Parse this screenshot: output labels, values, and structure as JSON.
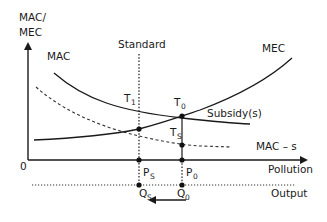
{
  "diagram": {
    "y_axis_label_line1": "MAC/",
    "y_axis_label_line2": "MEC",
    "origin_label": "0",
    "x_axis_label": "Pollution",
    "output_axis_label": "Output",
    "curves": {
      "mac": "MAC",
      "mec": "MEC",
      "mac_minus_s": "MAC – s",
      "subsidy": "Subsidy(s)"
    },
    "standard_label": "Standard",
    "points": {
      "t1": {
        "main": "T",
        "sub": "1"
      },
      "t0": {
        "main": "T",
        "sub": "0"
      },
      "ts": {
        "main": "T",
        "sub": "S"
      },
      "ps": {
        "main": "P",
        "sub": "S"
      },
      "p0": {
        "main": "P",
        "sub": "0"
      },
      "qs": {
        "main": "Q",
        "sub": "S"
      },
      "q0": {
        "main": "Q",
        "sub": "0"
      }
    },
    "arrow_direction": "left"
  }
}
